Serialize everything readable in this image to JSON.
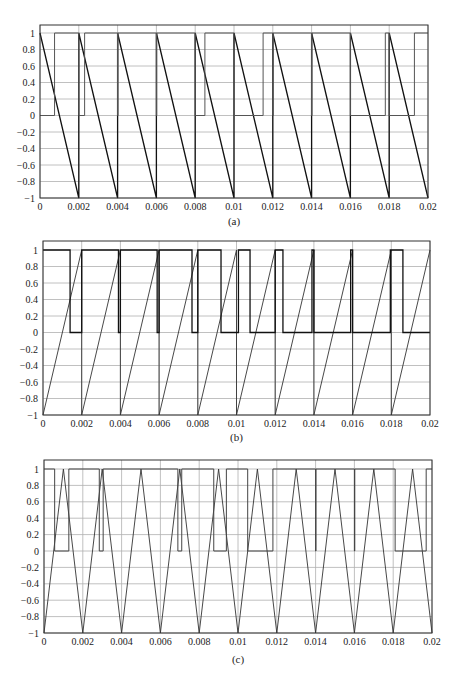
{
  "chart_data": [
    {
      "type": "line",
      "caption": "(a)",
      "xlim": [
        0,
        0.02
      ],
      "ylim": [
        -1,
        1.1
      ],
      "grid": true,
      "xticks": [
        "0",
        "0.002",
        "0.004",
        "0.006",
        "0.008",
        "0.01",
        "0.012",
        "0.014",
        "0.016",
        "0.018",
        "0.02"
      ],
      "yticks": [
        "1",
        "0.8",
        "0.6",
        "0.4",
        "0.2",
        "0",
        "-0.2",
        "-0.4",
        "-0.6",
        "-0.8",
        "-1"
      ],
      "series": [
        {
          "name": "sawtooth carrier (falling)",
          "x": [
            0,
            0.002,
            0.002,
            0.004,
            0.004,
            0.006,
            0.006,
            0.008,
            0.008,
            0.01,
            0.01,
            0.012,
            0.012,
            0.014,
            0.014,
            0.016,
            0.016,
            0.018,
            0.018,
            0.02
          ],
          "y": [
            1,
            -1,
            1,
            -1,
            1,
            -1,
            1,
            -1,
            1,
            -1,
            1,
            -1,
            1,
            -1,
            1,
            -1,
            1,
            -1,
            1,
            -1
          ],
          "stroke": "#111111",
          "width": 1.3
        },
        {
          "name": "PWM output",
          "x": [
            0,
            0.00075,
            0.00075,
            0.002,
            0.002,
            0.0023,
            0.0023,
            0.004,
            0.004,
            0.00402,
            0.00402,
            0.006,
            0.006,
            0.00602,
            0.00602,
            0.008,
            0.008,
            0.0085,
            0.0085,
            0.01,
            0.01,
            0.0115,
            0.0115,
            0.012,
            0.012,
            0.01202,
            0.01202,
            0.014,
            0.014,
            0.01402,
            0.01402,
            0.016,
            0.016,
            0.0178,
            0.0178,
            0.018,
            0.018,
            0.0193,
            0.0193,
            0.02
          ],
          "y": [
            0,
            0,
            1,
            1,
            0,
            0,
            1,
            1,
            0,
            0,
            1,
            1,
            0,
            0,
            1,
            1,
            0,
            0,
            1,
            1,
            0,
            0,
            1,
            1,
            0,
            0,
            1,
            1,
            0,
            0,
            1,
            1,
            0,
            0,
            1,
            1,
            0,
            0,
            1,
            1
          ],
          "stroke": "#555555",
          "width": 1
        }
      ]
    },
    {
      "type": "line",
      "caption": "(b)",
      "xlim": [
        0,
        0.02
      ],
      "ylim": [
        -1,
        1.1
      ],
      "grid": true,
      "xticks": [
        "0",
        "0.002",
        "0.004",
        "0.006",
        "0.008",
        "0.01",
        "0.012",
        "0.014",
        "0.016",
        "0.018",
        "0.02"
      ],
      "yticks": [
        "1",
        "0.8",
        "0.6",
        "0.4",
        "0.2",
        "0",
        "-0.2",
        "-0.4",
        "-0.6",
        "-0.8",
        "-1"
      ],
      "series": [
        {
          "name": "sawtooth carrier (rising)",
          "x": [
            0,
            0.002,
            0.002,
            0.004,
            0.004,
            0.006,
            0.006,
            0.008,
            0.008,
            0.01,
            0.01,
            0.012,
            0.012,
            0.014,
            0.014,
            0.016,
            0.016,
            0.018,
            0.018,
            0.02
          ],
          "y": [
            -1,
            1,
            -1,
            1,
            -1,
            1,
            -1,
            1,
            -1,
            1,
            -1,
            1,
            -1,
            1,
            -1,
            1,
            -1,
            1,
            -1,
            1
          ],
          "stroke": "#333333",
          "width": 0.9
        },
        {
          "name": "PWM output",
          "x": [
            0,
            0.0014,
            0.0014,
            0.002,
            0.002,
            0.0039,
            0.0039,
            0.004,
            0.004,
            0.0059,
            0.0059,
            0.006,
            0.006,
            0.0077,
            0.0077,
            0.008,
            0.008,
            0.0092,
            0.0092,
            0.0101,
            0.0101,
            0.0107,
            0.0107,
            0.012,
            0.012,
            0.0124,
            0.0124,
            0.0139,
            0.0139,
            0.014,
            0.014,
            0.0159,
            0.0159,
            0.016,
            0.016,
            0.01795,
            0.01795,
            0.0186,
            0.0186,
            0.02
          ],
          "y": [
            1,
            1,
            0,
            0,
            1,
            1,
            0,
            0,
            1,
            1,
            0,
            0,
            1,
            1,
            0,
            0,
            1,
            1,
            0,
            0,
            1,
            1,
            0,
            0,
            1,
            1,
            0,
            0,
            1,
            1,
            0,
            0,
            1,
            1,
            0,
            0,
            1,
            1,
            0,
            0
          ],
          "stroke": "#111111",
          "width": 1.3
        }
      ]
    },
    {
      "type": "line",
      "caption": "(c)",
      "xlim": [
        0,
        0.02
      ],
      "ylim": [
        -1,
        1.1
      ],
      "grid": true,
      "xticks": [
        "0",
        "0.002",
        "0.004",
        "0.006",
        "0.008",
        "0.01",
        "0.012",
        "0.014",
        "0.016",
        "0.018",
        "0.02"
      ],
      "yticks": [
        "1",
        "0.8",
        "0.6",
        "0.4",
        "0.2",
        "0",
        "-0.2",
        "-0.4",
        "-0.6",
        "-0.8",
        "-1"
      ],
      "series": [
        {
          "name": "triangle carrier",
          "x": [
            0,
            0.001,
            0.002,
            0.003,
            0.004,
            0.005,
            0.006,
            0.007,
            0.008,
            0.009,
            0.01,
            0.011,
            0.012,
            0.013,
            0.014,
            0.015,
            0.016,
            0.017,
            0.018,
            0.019,
            0.02
          ],
          "y": [
            -1,
            1,
            -1,
            1,
            -1,
            1,
            -1,
            1,
            -1,
            1,
            -1,
            1,
            -1,
            1,
            -1,
            1,
            -1,
            1,
            -1,
            1,
            -1
          ],
          "stroke": "#333333",
          "width": 0.9
        },
        {
          "name": "PWM output",
          "x": [
            0,
            0.00055,
            0.00055,
            0.00128,
            0.00128,
            0.00285,
            0.00285,
            0.00305,
            0.00305,
            0.0069,
            0.0069,
            0.0071,
            0.0071,
            0.00875,
            0.00875,
            0.0094,
            0.0094,
            0.0105,
            0.0105,
            0.0118,
            0.0118,
            0.014,
            0.014,
            0.01402,
            0.01402,
            0.016,
            0.016,
            0.01602,
            0.01602,
            0.0181,
            0.0181,
            0.0197,
            0.0197,
            0.02
          ],
          "y": [
            1,
            1,
            0,
            0,
            1,
            1,
            0,
            0,
            1,
            1,
            0,
            0,
            1,
            1,
            0,
            0,
            1,
            1,
            0,
            0,
            1,
            1,
            0,
            0,
            1,
            1,
            0,
            0,
            1,
            1,
            0,
            0,
            1,
            1
          ],
          "stroke": "#444444",
          "width": 1
        }
      ]
    }
  ],
  "layout": {
    "panels": [
      {
        "left": 40,
        "right": 428,
        "frame_top": 25,
        "y_one": 33,
        "y_minus_one": 198,
        "caption_y": 225
      },
      {
        "left": 43,
        "right": 430,
        "frame_top": 241,
        "y_one": 250,
        "y_minus_one": 415,
        "caption_y": 441
      },
      {
        "left": 44,
        "right": 432,
        "frame_top": 460,
        "y_one": 469,
        "y_minus_one": 633,
        "caption_y": 663
      }
    ],
    "colors": {
      "grid": "#b0b0b0",
      "frame": "#333333",
      "text": "#222222"
    }
  }
}
